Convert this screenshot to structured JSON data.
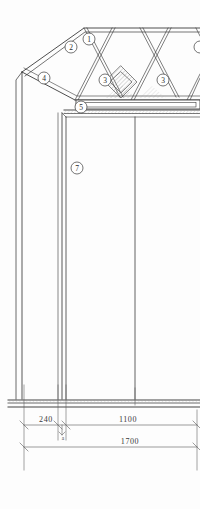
{
  "drawing": {
    "title": "Structural section - lattice truss over column",
    "background_color": "#fdfdfd",
    "line_color": "#3a3a3a",
    "hatch_color": "#9a9a9a"
  },
  "callouts": [
    {
      "id": "callout-1",
      "label": "1",
      "cx": 89,
      "cy": 39
    },
    {
      "id": "callout-2",
      "label": "2",
      "cx": 71,
      "cy": 47
    },
    {
      "id": "callout-4",
      "label": "4",
      "cx": 44,
      "cy": 78
    },
    {
      "id": "callout-3-left",
      "label": "3",
      "cx": 105,
      "cy": 80
    },
    {
      "id": "callout-3-right",
      "label": "3",
      "cx": 163,
      "cy": 80
    },
    {
      "id": "callout-5",
      "label": "5",
      "cx": 81,
      "cy": 107
    },
    {
      "id": "callout-7",
      "label": "7",
      "cx": 77,
      "cy": 168
    }
  ],
  "callout_edge_partial": {
    "id": "callout-edge",
    "cx": 199,
    "cy": 47
  },
  "dimensions": [
    {
      "id": "dim-240",
      "value": "240",
      "x": 46,
      "y": 428,
      "align": "middle"
    },
    {
      "id": "dim-1100",
      "value": "1100",
      "x": 128,
      "y": 428,
      "align": "middle"
    },
    {
      "id": "dim-1700",
      "value": "1700",
      "x": 130,
      "y": 450,
      "align": "middle"
    }
  ],
  "annotation_small": {
    "id": "annotation-a",
    "value": "a",
    "x": 63,
    "y": 437
  }
}
